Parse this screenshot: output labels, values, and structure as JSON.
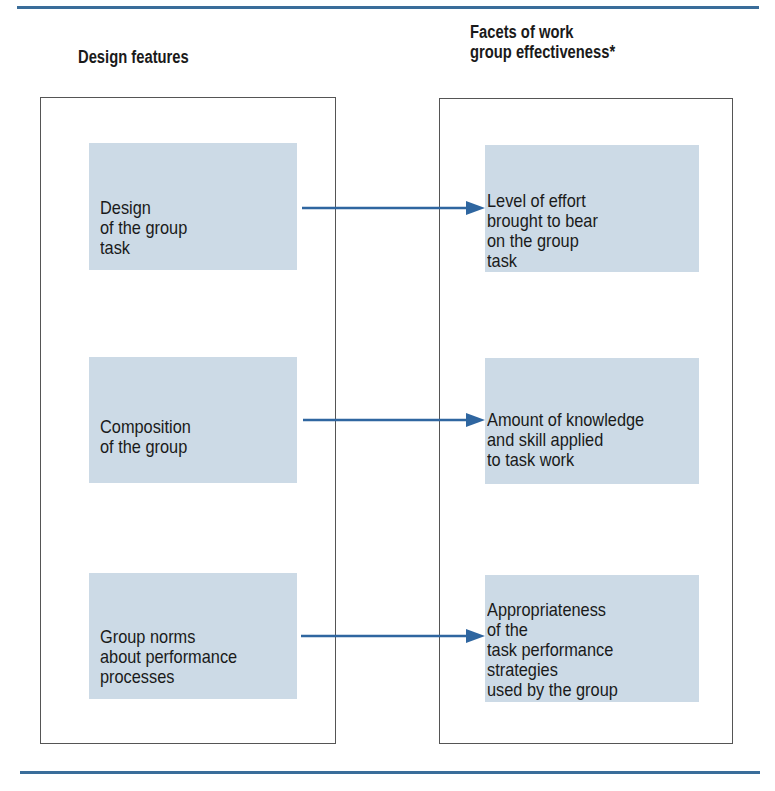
{
  "diagram": {
    "type": "flow",
    "colors": {
      "rule": "#3a6d9a",
      "arrow": "#2f66a0",
      "node_fill": "#ccdae6",
      "box_border": "#555555",
      "text": "#1a1a1a"
    },
    "columns": {
      "left": {
        "heading": "Design features",
        "nodes": [
          {
            "id": "design-task",
            "label": "Design\nof the group\ntask"
          },
          {
            "id": "composition",
            "label": "Composition\nof the group"
          },
          {
            "id": "norms",
            "label": "Group norms\nabout performance\nprocesses"
          }
        ]
      },
      "right": {
        "heading": "Facets of work\ngroup effectiveness*",
        "nodes": [
          {
            "id": "effort",
            "label": "Level of effort\nbrought to bear\non the group\ntask"
          },
          {
            "id": "knowledge",
            "label": "Amount of knowledge\nand skill applied\nto task work"
          },
          {
            "id": "strategies",
            "label": "Appropriateness\nof the\ntask performance\nstrategies\nused by the group"
          }
        ]
      }
    },
    "edges": [
      {
        "from": "design-task",
        "to": "effort"
      },
      {
        "from": "composition",
        "to": "knowledge"
      },
      {
        "from": "norms",
        "to": "strategies"
      }
    ]
  }
}
